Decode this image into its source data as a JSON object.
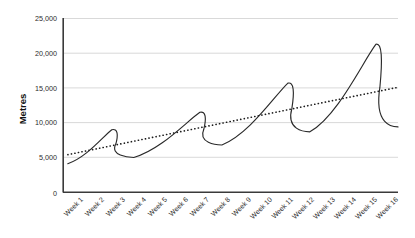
{
  "chart_data": {
    "type": "line",
    "title": "",
    "xlabel": "",
    "ylabel": "Metres",
    "ylim": [
      0,
      25000
    ],
    "ytick_values": [
      0,
      5000,
      10000,
      15000,
      20000,
      25000
    ],
    "ytick_labels": [
      "0",
      "5,000",
      "10,000",
      "15,000",
      "20,000",
      "25,000"
    ],
    "categories": [
      "Week 1",
      "Week 2",
      "Week 3",
      "Week 4",
      "Week 5",
      "Week 6",
      "Week 7",
      "Week 8",
      "Week 9",
      "Week 10",
      "Week 11",
      "Week 12",
      "Week 13",
      "Week 14",
      "Week 15",
      "Week 16"
    ],
    "grid": "horizontal",
    "legend": "none",
    "series": [
      {
        "name": "Metres",
        "style": "solid-sawtooth-curve",
        "color": "#2a2a2a",
        "values": [
          4100,
          6200,
          9000,
          5000,
          6100,
          8500,
          11500,
          6800,
          9500,
          14200,
          15700,
          8700,
          11500,
          16500,
          21300,
          9400
        ],
        "cycle_peaks": [
          {
            "week": "Week 3",
            "value": 9000
          },
          {
            "week": "Week 7",
            "value": 11500
          },
          {
            "week": "Week 11",
            "value": 15700
          },
          {
            "week": "Week 15",
            "value": 21300
          }
        ],
        "cycle_troughs": [
          {
            "week": "Week 4",
            "value": 5000
          },
          {
            "week": "Week 8",
            "value": 6800
          },
          {
            "week": "Week 12",
            "value": 8700
          },
          {
            "week": "Week 16",
            "value": 9400
          }
        ]
      },
      {
        "name": "Trendline",
        "style": "dotted-linear",
        "color": "#1d1d1d",
        "start_value": 5400,
        "end_value": 15100,
        "values": [
          5400,
          6047,
          6693,
          7340,
          7987,
          8633,
          9280,
          9927,
          10573,
          11220,
          11867,
          12513,
          13160,
          13807,
          14453,
          15100
        ]
      }
    ]
  },
  "axes": {
    "y_axis_name": "y-axis",
    "x_axis_name": "x-axis"
  }
}
